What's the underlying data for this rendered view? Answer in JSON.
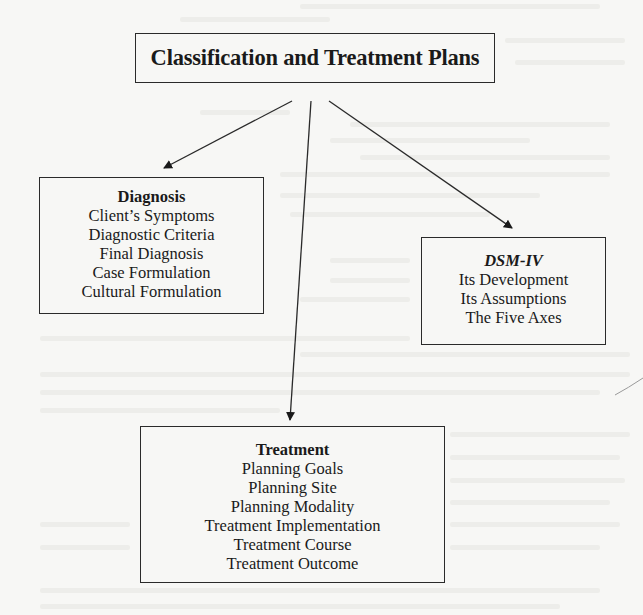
{
  "diagram": {
    "title": "Classification and Treatment Plans",
    "nodes": [
      {
        "id": "diagnosis",
        "heading": "Diagnosis",
        "heading_style": "bold",
        "items": [
          "Client’s Symptoms",
          "Diagnostic Criteria",
          "Final Diagnosis",
          "Case Formulation",
          "Cultural Formulation"
        ]
      },
      {
        "id": "dsm",
        "heading": "DSM-IV",
        "heading_style": "bold-italic",
        "items": [
          "Its Development",
          "Its Assumptions",
          "The Five Axes"
        ]
      },
      {
        "id": "treatment",
        "heading": "Treatment",
        "heading_style": "bold",
        "items": [
          "Planning Goals",
          "Planning Site",
          "Planning Modality",
          "Treatment Implementation",
          "Treatment Course",
          "Treatment Outcome"
        ]
      }
    ],
    "edges": [
      {
        "from": "title",
        "to": "diagnosis"
      },
      {
        "from": "title",
        "to": "treatment"
      },
      {
        "from": "title",
        "to": "dsm"
      }
    ]
  },
  "colors": {
    "background": "#f7f7f5",
    "ink": "#1a1a1a",
    "border": "#2a2a2a"
  }
}
